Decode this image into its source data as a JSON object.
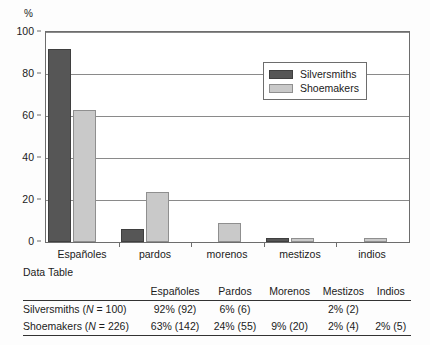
{
  "chart_data": {
    "type": "bar",
    "title": "",
    "xlabel": "",
    "ylabel": "%",
    "ylim": [
      0,
      100
    ],
    "yticks": [
      0,
      20,
      40,
      60,
      80,
      100
    ],
    "grid": true,
    "legend_position": "top-right-inside",
    "categories": [
      "Españoles",
      "pardos",
      "morenos",
      "mestizos",
      "indios"
    ],
    "series": [
      {
        "name": "Silversmiths",
        "color": "#565656",
        "values": [
          92,
          6,
          0,
          2,
          0
        ]
      },
      {
        "name": "Shoemakers",
        "color": "#c9c9c9",
        "values": [
          63,
          24,
          9,
          2,
          2
        ]
      }
    ]
  },
  "axis": {
    "unit_label": "%",
    "y_tick_labels": [
      "100",
      "80",
      "60",
      "40",
      "20",
      "0"
    ],
    "x_tick_labels": [
      "Españoles",
      "pardos",
      "morenos",
      "mestizos",
      "indios"
    ]
  },
  "legend": {
    "items": [
      {
        "label": "Silversmiths"
      },
      {
        "label": "Shoemakers"
      }
    ]
  },
  "table": {
    "caption": "Data Table",
    "row_header_blank": "",
    "columns": [
      "Españoles",
      "Pardos",
      "Morenos",
      "Mestizos",
      "Indios"
    ],
    "rows": [
      {
        "label_prefix": "Silversmiths (",
        "label_n": "N",
        "label_suffix": " = 100)",
        "cells": [
          "92%  (92)",
          "6%  (6)",
          "",
          "2% (2)",
          ""
        ]
      },
      {
        "label_prefix": "Shoemakers (",
        "label_n": "N",
        "label_suffix": " = 226)",
        "cells": [
          "63% (142)",
          "24% (55)",
          "9% (20)",
          "2% (4)",
          "2% (5)"
        ]
      }
    ]
  }
}
